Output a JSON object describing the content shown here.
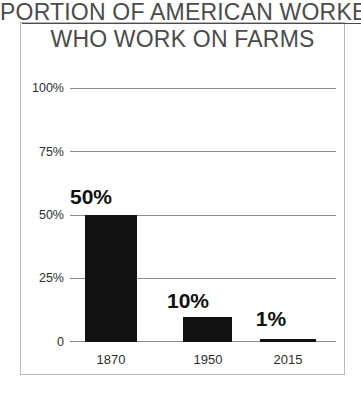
{
  "chart_data": {
    "type": "bar",
    "title": "PORTION OF AMERICAN WORKERS WHO WORK ON FARMS",
    "title_line1": "PORTION OF AMERICAN WORKERS",
    "title_line2": "WHO WORK ON FARMS",
    "categories": [
      "1870",
      "1950",
      "2015"
    ],
    "values": [
      50,
      10,
      1
    ],
    "value_labels": [
      "50%",
      "10%",
      "1%"
    ],
    "xlabel": "",
    "ylabel": "",
    "ylim": [
      0,
      100
    ],
    "yticks": [
      0,
      25,
      50,
      75,
      100
    ],
    "ytick_labels": [
      "0",
      "25%",
      "50%",
      "75%",
      "100%"
    ],
    "grid": true,
    "legend": false,
    "series": [
      {
        "name": "Portion of American workers who work on farms",
        "values": [
          50,
          10,
          1
        ]
      }
    ],
    "colors": {
      "bar": "#111111",
      "gridline": "#8d8d8d",
      "title_text": "#4b4b4b",
      "axis_text": "#2e2e2e",
      "frame": "#b9b9b9",
      "background": "#ffffff"
    }
  }
}
